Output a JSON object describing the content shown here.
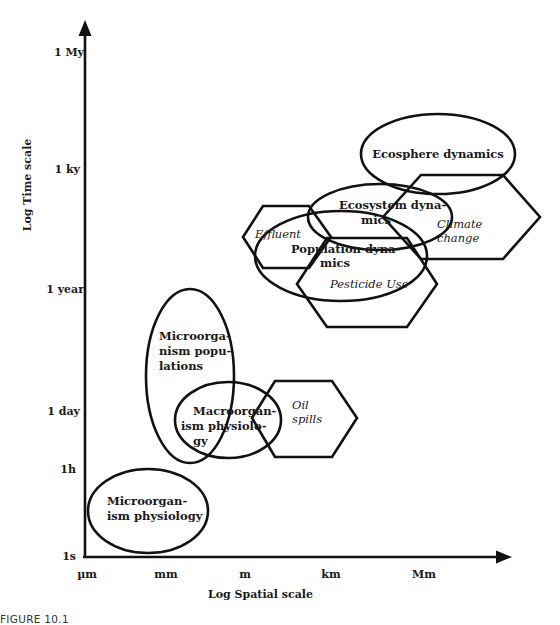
{
  "figure_caption": "FIGURE 10.1",
  "axes": {
    "y_label": "Log Time scale",
    "x_label": "Log Spatial scale",
    "y_ticks": [
      "1 My",
      "1 ky",
      "1 year",
      "1 day",
      "1h",
      "1s"
    ],
    "x_ticks": [
      "µm",
      "mm",
      "m",
      "km",
      "Mm"
    ]
  },
  "processes": {
    "microorganism_physiology": {
      "line1": "Microorgan-",
      "line2": "ism physiology",
      "shape": "ellipse"
    },
    "microorganism_populations": {
      "line1": "Microorga-",
      "line2": "nism popu-",
      "line3": "lations",
      "shape": "ellipse"
    },
    "macroorganism_physiology": {
      "line1": "Macroorgan-",
      "line2": "ism physiolo-",
      "line3": "gy",
      "shape": "ellipse"
    },
    "population_dynamics": {
      "line1": "Population dyna-",
      "line2": "mics",
      "shape": "ellipse"
    },
    "ecosystem_dynamics": {
      "line1": "Ecosystem dyna-",
      "line2": "mics",
      "shape": "ellipse"
    },
    "ecosphere_dynamics": {
      "line1": "Ecosphere dynamics",
      "shape": "ellipse"
    }
  },
  "stressors": {
    "oil_spills": {
      "line1": "Oil",
      "line2": "spills",
      "shape": "hexagon"
    },
    "effluent": {
      "line1": "Effluent",
      "shape": "hexagon"
    },
    "pesticide_use": {
      "line1": "Pesticide Use",
      "shape": "hexagon"
    },
    "climate_change": {
      "line1": "Climate",
      "line2": "change",
      "shape": "hexagon"
    }
  }
}
